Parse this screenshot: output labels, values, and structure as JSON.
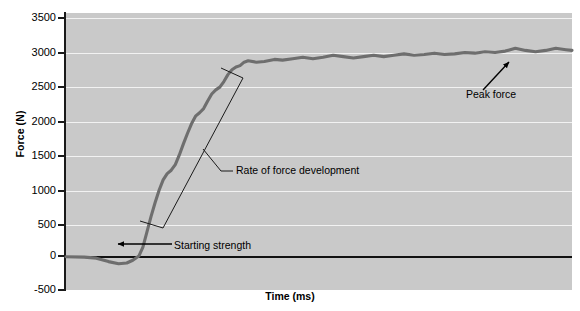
{
  "chart_data": {
    "type": "line",
    "title": "",
    "xlabel": "Time (ms)",
    "ylabel": "Force (N)",
    "ylim": [
      -500,
      3500
    ],
    "yticks": [
      3500,
      3000,
      2500,
      2000,
      1500,
      1000,
      500,
      0,
      -500
    ],
    "ytick_labels": [
      "3500",
      "3000",
      "2500",
      "2000",
      "1500",
      "1000",
      "500",
      "0",
      "-500"
    ],
    "xticks": [],
    "xtick_labels": [],
    "grid": true,
    "legend": "none",
    "background_color": "#c9c9c9",
    "gridline_color": "#f2f2f2",
    "series": [
      {
        "name": "Force-time curve",
        "color": "#6e6e6e",
        "points": [
          [
            0,
            -20
          ],
          [
            18,
            -25
          ],
          [
            30,
            -40
          ],
          [
            42,
            -90
          ],
          [
            52,
            -120
          ],
          [
            60,
            -110
          ],
          [
            66,
            -70
          ],
          [
            72,
            -10
          ],
          [
            76,
            120
          ],
          [
            80,
            340
          ],
          [
            84,
            560
          ],
          [
            88,
            760
          ],
          [
            92,
            940
          ],
          [
            96,
            1090
          ],
          [
            100,
            1180
          ],
          [
            104,
            1230
          ],
          [
            108,
            1310
          ],
          [
            112,
            1450
          ],
          [
            116,
            1610
          ],
          [
            120,
            1760
          ],
          [
            124,
            1900
          ],
          [
            128,
            2010
          ],
          [
            132,
            2060
          ],
          [
            136,
            2120
          ],
          [
            140,
            2230
          ],
          [
            144,
            2330
          ],
          [
            148,
            2390
          ],
          [
            152,
            2430
          ],
          [
            156,
            2510
          ],
          [
            160,
            2610
          ],
          [
            164,
            2680
          ],
          [
            168,
            2720
          ],
          [
            172,
            2740
          ],
          [
            176,
            2790
          ],
          [
            180,
            2810
          ],
          [
            188,
            2790
          ],
          [
            196,
            2800
          ],
          [
            206,
            2830
          ],
          [
            214,
            2820
          ],
          [
            224,
            2840
          ],
          [
            234,
            2860
          ],
          [
            244,
            2840
          ],
          [
            254,
            2860
          ],
          [
            264,
            2890
          ],
          [
            274,
            2870
          ],
          [
            284,
            2850
          ],
          [
            294,
            2870
          ],
          [
            304,
            2890
          ],
          [
            314,
            2870
          ],
          [
            324,
            2890
          ],
          [
            334,
            2910
          ],
          [
            344,
            2890
          ],
          [
            354,
            2900
          ],
          [
            364,
            2920
          ],
          [
            374,
            2900
          ],
          [
            384,
            2910
          ],
          [
            394,
            2930
          ],
          [
            404,
            2920
          ],
          [
            414,
            2940
          ],
          [
            424,
            2930
          ],
          [
            434,
            2950
          ],
          [
            444,
            2990
          ],
          [
            454,
            2960
          ],
          [
            464,
            2940
          ],
          [
            474,
            2960
          ],
          [
            484,
            2990
          ],
          [
            494,
            2970
          ],
          [
            500,
            2960
          ]
        ]
      }
    ],
    "annotations": [
      {
        "id": "rate-of-force-development",
        "text": "Rate of force development",
        "kind": "bracket-callout",
        "note": "Elongated open bracket enclosing the steep rising limb of the curve"
      },
      {
        "id": "starting-strength",
        "text": "Starting strength",
        "kind": "arrow-callout",
        "note": "Arrow pointing left to the onset of the force rise near 0 N"
      },
      {
        "id": "peak-force",
        "text": "Peak force",
        "kind": "arrow-callout",
        "note": "Arrow pointing up-right to the highest plateau point of the curve"
      }
    ]
  },
  "axes": {
    "y_title": "Force (N)",
    "x_title": "Time (ms)",
    "y_labels": [
      "3500",
      "3000",
      "2500",
      "2000",
      "1500",
      "1000",
      "500",
      "0",
      "-500"
    ]
  },
  "annotations": {
    "rate_of_force_development": "Rate of force development",
    "starting_strength": "Starting strength",
    "peak_force": "Peak force"
  },
  "colors": {
    "plot_background": "#c9c9c9",
    "gridline": "#f2f2f2",
    "curve": "#6e6e6e",
    "axis": "#1a1a1a",
    "text": "#000000"
  }
}
